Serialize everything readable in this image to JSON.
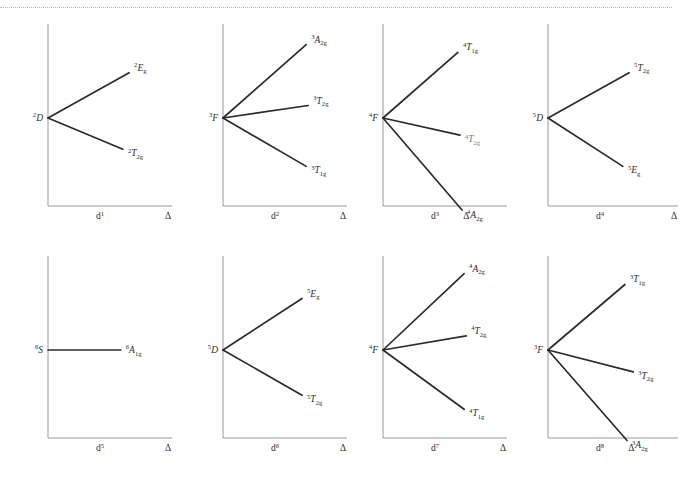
{
  "figure": {
    "top_rule": "dotted-separator",
    "axis_color": "#9a9a9a",
    "line_color": "#2b2b2b",
    "text_color": "#2b2b2b"
  },
  "chart_data": {
    "type": "line",
    "xlabel": "Δ",
    "ylabel": "",
    "grid": false,
    "legend": "none",
    "panels": [
      {
        "id": "d1",
        "config_label": "d",
        "config_sup": "1",
        "delta_label": "Δ",
        "origin_term": {
          "pre": "2",
          "body": "D",
          "sub": ""
        },
        "origin_y": 0.0,
        "lines": [
          {
            "label_pre": "2",
            "label_body": "E",
            "label_sub": "g",
            "slope": "up",
            "x_end": 0.78,
            "y_end": 0.58,
            "below_axis": false
          },
          {
            "label_pre": "2",
            "label_body": "T",
            "label_sub": "2g",
            "slope": "down",
            "x_end": 0.72,
            "y_end": -0.4,
            "below_axis": false
          }
        ]
      },
      {
        "id": "d2",
        "config_label": "d",
        "config_sup": "2",
        "delta_label": "Δ",
        "origin_term": {
          "pre": "3",
          "body": "F",
          "sub": ""
        },
        "origin_y": 0.0,
        "lines": [
          {
            "label_pre": "3",
            "label_body": "A",
            "label_sub": "2g",
            "slope": "up",
            "x_end": 0.8,
            "y_end": 0.94,
            "below_axis": false
          },
          {
            "label_pre": "3",
            "label_body": "T",
            "label_sub": "2g",
            "slope": "up",
            "x_end": 0.82,
            "y_end": 0.16,
            "below_axis": false
          },
          {
            "label_pre": "3",
            "label_body": "T",
            "label_sub": "1g",
            "slope": "down",
            "x_end": 0.8,
            "y_end": -0.62,
            "below_axis": false
          }
        ]
      },
      {
        "id": "d3",
        "config_label": "d",
        "config_sup": "3",
        "delta_label": "Δ",
        "origin_term": {
          "pre": "4",
          "body": "F",
          "sub": ""
        },
        "origin_y": 0.0,
        "lines": [
          {
            "label_pre": "4",
            "label_body": "T",
            "label_sub": "1g",
            "slope": "up",
            "x_end": 0.72,
            "y_end": 0.84,
            "below_axis": false
          },
          {
            "label_pre": "4",
            "label_body": "T",
            "label_sub": "2g",
            "slope": "down",
            "x_end": 0.74,
            "y_end": -0.22,
            "below_axis": false,
            "faint_sup": true
          },
          {
            "label_pre": "4",
            "label_body": "A",
            "label_sub": "2g",
            "slope": "down",
            "x_end": 0.76,
            "y_end": -1.18,
            "below_axis": true
          }
        ]
      },
      {
        "id": "d4",
        "config_label": "d",
        "config_sup": "4",
        "delta_label": "Δ",
        "origin_term": {
          "pre": "5",
          "body": "D",
          "sub": ""
        },
        "origin_y": 0.0,
        "lines": [
          {
            "label_pre": "5",
            "label_body": "T",
            "label_sub": "2g",
            "slope": "up",
            "x_end": 0.78,
            "y_end": 0.58,
            "below_axis": false
          },
          {
            "label_pre": "5",
            "label_body": "E",
            "label_sub": "g",
            "slope": "down",
            "x_end": 0.72,
            "y_end": -0.62,
            "below_axis": false
          }
        ]
      },
      {
        "id": "d5",
        "config_label": "d",
        "config_sup": "5",
        "delta_label": "Δ",
        "origin_term": {
          "pre": "6",
          "body": "S",
          "sub": ""
        },
        "origin_y": 0.0,
        "lines": [
          {
            "label_pre": "6",
            "label_body": "A",
            "label_sub": "1g",
            "slope": "flat",
            "x_end": 0.7,
            "y_end": 0.0,
            "below_axis": false
          }
        ]
      },
      {
        "id": "d6",
        "config_label": "d",
        "config_sup": "6",
        "delta_label": "Δ",
        "origin_term": {
          "pre": "5",
          "body": "D",
          "sub": ""
        },
        "origin_y": 0.0,
        "lines": [
          {
            "label_pre": "5",
            "label_body": "E",
            "label_sub": "g",
            "slope": "up",
            "x_end": 0.76,
            "y_end": 0.66,
            "below_axis": false
          },
          {
            "label_pre": "5",
            "label_body": "T",
            "label_sub": "2g",
            "slope": "down",
            "x_end": 0.76,
            "y_end": -0.58,
            "below_axis": false
          }
        ]
      },
      {
        "id": "d7",
        "config_label": "d",
        "config_sup": "7",
        "delta_label": "Δ",
        "origin_term": {
          "pre": "4",
          "body": "F",
          "sub": ""
        },
        "origin_y": 0.0,
        "lines": [
          {
            "label_pre": "4",
            "label_body": "A",
            "label_sub": "2g",
            "slope": "up",
            "x_end": 0.78,
            "y_end": 0.98,
            "below_axis": false
          },
          {
            "label_pre": "4",
            "label_body": "T",
            "label_sub": "2g",
            "slope": "up",
            "x_end": 0.8,
            "y_end": 0.18,
            "below_axis": false
          },
          {
            "label_pre": "4",
            "label_body": "T",
            "label_sub": "1g",
            "slope": "down",
            "x_end": 0.78,
            "y_end": -0.76,
            "below_axis": false
          }
        ]
      },
      {
        "id": "d8",
        "config_label": "d",
        "config_sup": "8",
        "delta_label": "Δ",
        "origin_term": {
          "pre": "3",
          "body": "F",
          "sub": ""
        },
        "origin_y": 0.0,
        "lines": [
          {
            "label_pre": "3",
            "label_body": "T",
            "label_sub": "1g",
            "slope": "up",
            "x_end": 0.74,
            "y_end": 0.84,
            "below_axis": false
          },
          {
            "label_pre": "3",
            "label_body": "T",
            "label_sub": "2g",
            "slope": "down",
            "x_end": 0.82,
            "y_end": -0.28,
            "below_axis": false
          },
          {
            "label_pre": "3",
            "label_body": "A",
            "label_sub": "2g",
            "slope": "down",
            "x_end": 0.76,
            "y_end": -1.16,
            "below_axis": true
          }
        ]
      }
    ]
  }
}
